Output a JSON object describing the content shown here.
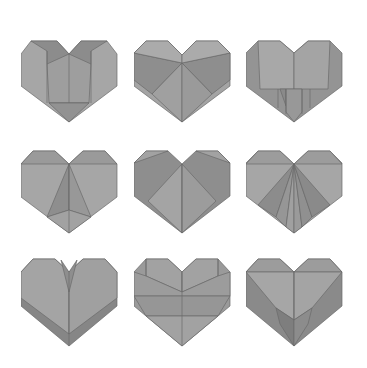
{
  "image": {
    "description": "Grid of nine grey origami paper hearts, each with a different fold pattern",
    "background": "#ffffff",
    "colors": {
      "light": "#a8a8a8",
      "mid": "#9a9a9a",
      "dark": "#8a8a8a",
      "darker": "#7c7c7c",
      "line": "#6a6a6a"
    },
    "grid": {
      "rows": 3,
      "cols": 3
    },
    "hearts": [
      {
        "row": 1,
        "col": 1,
        "variant": "center-pocket-flap"
      },
      {
        "row": 1,
        "col": 2,
        "variant": "diagonal-cross"
      },
      {
        "row": 1,
        "col": 3,
        "variant": "square-front-panel"
      },
      {
        "row": 2,
        "col": 1,
        "variant": "center-triangle-spike"
      },
      {
        "row": 2,
        "col": 2,
        "variant": "large-diamond-front"
      },
      {
        "row": 2,
        "col": 3,
        "variant": "radiating-pleats"
      },
      {
        "row": 3,
        "col": 1,
        "variant": "v-notch-layered"
      },
      {
        "row": 3,
        "col": 2,
        "variant": "horizontal-bands"
      },
      {
        "row": 3,
        "col": 3,
        "variant": "inverted-v-pocket"
      }
    ]
  }
}
